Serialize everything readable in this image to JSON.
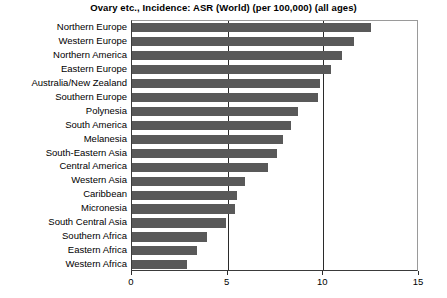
{
  "chart_data": {
    "type": "bar",
    "orientation": "horizontal",
    "title": "Ovary etc., Incidence: ASR (World) (per 100,000) (all ages)",
    "xlabel": "",
    "ylabel": "",
    "xlim": [
      0,
      15
    ],
    "xticks": [
      "0",
      "5",
      "10",
      "15"
    ],
    "xtick_values": [
      0,
      5,
      10,
      15
    ],
    "grid": "vertical gridlines at 5 and 10",
    "gridlines": [
      5,
      10
    ],
    "legend": "none",
    "bar_color": "#595959",
    "categories": [
      "Northern Europe",
      "Western Europe",
      "Northern America",
      "Eastern Europe",
      "Australia/New Zealand",
      "Southern Europe",
      "Polynesia",
      "South America",
      "Melanesia",
      "South-Eastern Asia",
      "Central America",
      "Western Asia",
      "Caribbean",
      "Micronesia",
      "South Central Asia",
      "Southern Africa",
      "Eastern Africa",
      "Western Africa"
    ],
    "values": [
      12.5,
      11.6,
      11.0,
      10.4,
      9.8,
      9.7,
      8.7,
      8.3,
      7.9,
      7.6,
      7.1,
      5.9,
      5.5,
      5.4,
      4.9,
      3.9,
      3.4,
      2.9
    ]
  }
}
